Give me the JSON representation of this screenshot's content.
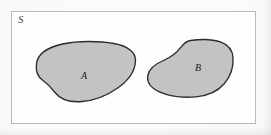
{
  "figure": {
    "type": "set-diagram",
    "caption_label_universe": "S",
    "colors": {
      "page_background": "#fbfbf9",
      "box_background": "#fefefe",
      "box_border": "#b9b9b9",
      "region_fill": "#c3c3c3",
      "region_stroke": "#2b2b2b",
      "label_text": "#171717",
      "universe_label_text": "#4a4a4a"
    },
    "universe": {
      "label": "S",
      "x": 11,
      "y": 11,
      "width": 245,
      "height": 113
    },
    "regions": [
      {
        "label": "A",
        "fill": "#c3c3c3",
        "stroke": "#2b2b2b",
        "label_x": 85,
        "label_y": 76
      },
      {
        "label": "B",
        "fill": "#c3c3c3",
        "stroke": "#2b2b2b",
        "label_x": 199,
        "label_y": 68
      }
    ]
  }
}
